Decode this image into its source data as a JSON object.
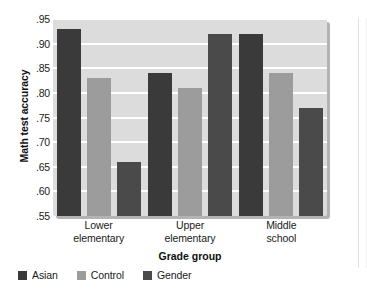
{
  "chart_data": {
    "type": "bar",
    "title": "",
    "xlabel": "Grade group",
    "ylabel": "Math test accuracy",
    "categories": [
      "Lower elementary",
      "Upper elementary",
      "Middle school"
    ],
    "category_lines": [
      [
        "Lower",
        "elementary"
      ],
      [
        "Upper",
        "elementary"
      ],
      [
        "Middle",
        "school"
      ]
    ],
    "series": [
      {
        "name": "Asian",
        "color": "#3a3a3a",
        "values": [
          0.93,
          0.84,
          0.92
        ]
      },
      {
        "name": "Control",
        "color": "#9c9c9c",
        "values": [
          0.83,
          0.81,
          0.84
        ]
      },
      {
        "name": "Gender",
        "color": "#4a4a4a",
        "values": [
          0.66,
          0.92,
          0.77
        ]
      }
    ],
    "ylim": [
      0.55,
      0.95
    ],
    "ytick_values": [
      0.95,
      0.9,
      0.85,
      0.8,
      0.75,
      0.7,
      0.65,
      0.6,
      0.55
    ],
    "ytick_labels": [
      ".95",
      ".90",
      ".85",
      ".80",
      ".75",
      ".70",
      ".65",
      ".60",
      ".55"
    ],
    "grid": true,
    "grid_color": "#ffffff",
    "plot_background": "#dcdcdc",
    "legend_position": "bottom-left"
  }
}
